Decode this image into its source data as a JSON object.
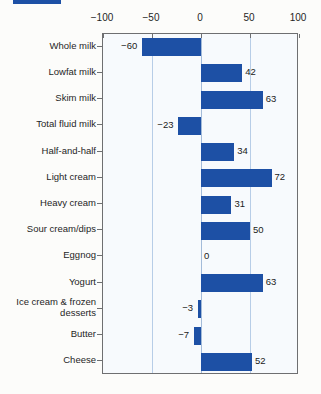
{
  "decoration": {
    "legend_swatch_color": "#1d50a5"
  },
  "colors": {
    "bar": "#1d50a5",
    "plot_background": "#f7fafd",
    "gridline": "#b7cde7",
    "zero_line": "#a3bbd9",
    "plot_border": "#6e6f71",
    "text": "#1f1f1f",
    "page_background": "#fcfcfa"
  },
  "chart_data": {
    "type": "bar",
    "orientation": "horizontal",
    "title": "",
    "xlabel": "",
    "ylabel": "",
    "categories": [
      "Whole milk",
      "Lowfat milk",
      "Skim milk",
      "Total fluid milk",
      "Half-and-half",
      "Light cream",
      "Heavy cream",
      "Sour cream/dips",
      "Eggnog",
      "Yogurt",
      "Ice cream & frozen desserts",
      "Butter",
      "Cheese"
    ],
    "values": [
      -60,
      42,
      63,
      -23,
      34,
      72,
      31,
      50,
      0,
      63,
      -3,
      -7,
      52
    ],
    "value_labels": [
      "−60",
      "42",
      "63",
      "−23",
      "34",
      "72",
      "31",
      "50",
      "0",
      "63",
      "−3",
      "−7",
      "52"
    ],
    "x_axis": {
      "position": "top",
      "range": [
        -100,
        100
      ],
      "ticks": [
        -100,
        -50,
        0,
        50,
        100
      ],
      "tick_labels": [
        "−100",
        "−50",
        "0",
        "50",
        "100"
      ]
    },
    "gridlines_at": [
      -50,
      0,
      50
    ],
    "legend_position": "none",
    "grid": true
  }
}
